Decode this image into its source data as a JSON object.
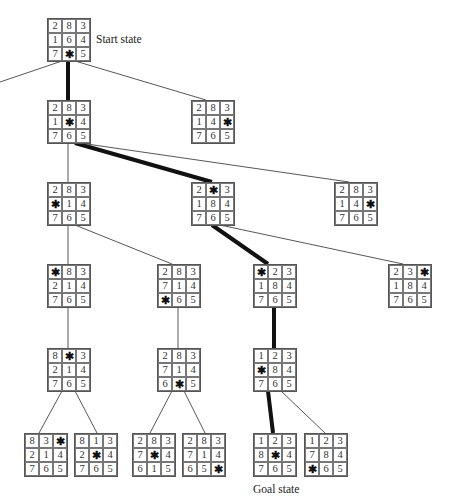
{
  "labels": {
    "start": "Start state",
    "goal": "Goal state"
  },
  "blank_symbol": "✱",
  "nodes": [
    {
      "id": "start",
      "x": 47,
      "y": 18,
      "cells": [
        "2",
        "8",
        "3",
        "1",
        "6",
        "4",
        "7",
        "*",
        "5"
      ]
    },
    {
      "id": "n1a",
      "x": 47,
      "y": 100,
      "cells": [
        "2",
        "8",
        "3",
        "1",
        "*",
        "4",
        "7",
        "6",
        "5"
      ]
    },
    {
      "id": "n1b",
      "x": 191,
      "y": 100,
      "cells": [
        "2",
        "8",
        "3",
        "1",
        "4",
        "*",
        "7",
        "6",
        "5"
      ]
    },
    {
      "id": "n2a",
      "x": 47,
      "y": 182,
      "cells": [
        "2",
        "8",
        "3",
        "*",
        "1",
        "4",
        "7",
        "6",
        "5"
      ]
    },
    {
      "id": "n2b",
      "x": 191,
      "y": 182,
      "cells": [
        "2",
        "*",
        "3",
        "1",
        "8",
        "4",
        "7",
        "6",
        "5"
      ]
    },
    {
      "id": "n2c",
      "x": 334,
      "y": 182,
      "cells": [
        "2",
        "8",
        "3",
        "1",
        "4",
        "*",
        "7",
        "6",
        "5"
      ]
    },
    {
      "id": "n3a",
      "x": 47,
      "y": 264,
      "cells": [
        "*",
        "8",
        "3",
        "2",
        "1",
        "4",
        "7",
        "6",
        "5"
      ]
    },
    {
      "id": "n3b",
      "x": 157,
      "y": 264,
      "cells": [
        "2",
        "8",
        "3",
        "7",
        "1",
        "4",
        "*",
        "6",
        "5"
      ]
    },
    {
      "id": "n3c",
      "x": 253,
      "y": 264,
      "cells": [
        "*",
        "2",
        "3",
        "1",
        "8",
        "4",
        "7",
        "6",
        "5"
      ]
    },
    {
      "id": "n3d",
      "x": 388,
      "y": 264,
      "cells": [
        "2",
        "3",
        "*",
        "1",
        "8",
        "4",
        "7",
        "6",
        "5"
      ]
    },
    {
      "id": "n4a",
      "x": 47,
      "y": 348,
      "cells": [
        "8",
        "*",
        "3",
        "2",
        "1",
        "4",
        "7",
        "6",
        "5"
      ]
    },
    {
      "id": "n4b",
      "x": 157,
      "y": 348,
      "cells": [
        "2",
        "8",
        "3",
        "7",
        "1",
        "4",
        "6",
        "*",
        "5"
      ]
    },
    {
      "id": "n4c",
      "x": 253,
      "y": 348,
      "cells": [
        "1",
        "2",
        "3",
        "*",
        "8",
        "4",
        "7",
        "6",
        "5"
      ]
    },
    {
      "id": "n5a",
      "x": 24,
      "y": 433,
      "cells": [
        "8",
        "3",
        "*",
        "2",
        "1",
        "4",
        "7",
        "6",
        "5"
      ]
    },
    {
      "id": "n5b",
      "x": 74,
      "y": 433,
      "cells": [
        "8",
        "1",
        "3",
        "2",
        "*",
        "4",
        "7",
        "6",
        "5"
      ]
    },
    {
      "id": "n5c",
      "x": 132,
      "y": 433,
      "cells": [
        "2",
        "8",
        "3",
        "7",
        "*",
        "4",
        "6",
        "1",
        "5"
      ]
    },
    {
      "id": "n5d",
      "x": 182,
      "y": 433,
      "cells": [
        "2",
        "8",
        "3",
        "7",
        "1",
        "4",
        "6",
        "5",
        "*"
      ]
    },
    {
      "id": "goal",
      "x": 253,
      "y": 433,
      "cells": [
        "1",
        "2",
        "3",
        "8",
        "*",
        "4",
        "7",
        "6",
        "5"
      ]
    },
    {
      "id": "n5f",
      "x": 304,
      "y": 433,
      "cells": [
        "1",
        "2",
        "3",
        "7",
        "8",
        "4",
        "*",
        "6",
        "5"
      ]
    }
  ],
  "edges": [
    {
      "x1": 62,
      "y1": 61,
      "x2": 0,
      "y2": 82,
      "bold": false
    },
    {
      "x1": 68,
      "y1": 61,
      "x2": 68,
      "y2": 100,
      "bold": true
    },
    {
      "x1": 75,
      "y1": 61,
      "x2": 206,
      "y2": 100,
      "bold": false
    },
    {
      "x1": 68,
      "y1": 143,
      "x2": 68,
      "y2": 182,
      "bold": false
    },
    {
      "x1": 75,
      "y1": 143,
      "x2": 212,
      "y2": 182,
      "bold": true
    },
    {
      "x1": 80,
      "y1": 143,
      "x2": 349,
      "y2": 182,
      "bold": false
    },
    {
      "x1": 68,
      "y1": 225,
      "x2": 68,
      "y2": 264,
      "bold": false
    },
    {
      "x1": 75,
      "y1": 225,
      "x2": 172,
      "y2": 264,
      "bold": false
    },
    {
      "x1": 212,
      "y1": 225,
      "x2": 268,
      "y2": 264,
      "bold": true
    },
    {
      "x1": 220,
      "y1": 225,
      "x2": 403,
      "y2": 264,
      "bold": false
    },
    {
      "x1": 68,
      "y1": 307,
      "x2": 68,
      "y2": 348,
      "bold": false
    },
    {
      "x1": 178,
      "y1": 307,
      "x2": 178,
      "y2": 348,
      "bold": false
    },
    {
      "x1": 274,
      "y1": 307,
      "x2": 274,
      "y2": 348,
      "bold": true
    },
    {
      "x1": 62,
      "y1": 391,
      "x2": 39,
      "y2": 433,
      "bold": false
    },
    {
      "x1": 75,
      "y1": 391,
      "x2": 97,
      "y2": 433,
      "bold": false
    },
    {
      "x1": 172,
      "y1": 391,
      "x2": 150,
      "y2": 433,
      "bold": false
    },
    {
      "x1": 184,
      "y1": 391,
      "x2": 205,
      "y2": 433,
      "bold": false
    },
    {
      "x1": 268,
      "y1": 391,
      "x2": 273,
      "y2": 433,
      "bold": true
    },
    {
      "x1": 281,
      "y1": 391,
      "x2": 325,
      "y2": 433,
      "bold": false
    }
  ]
}
